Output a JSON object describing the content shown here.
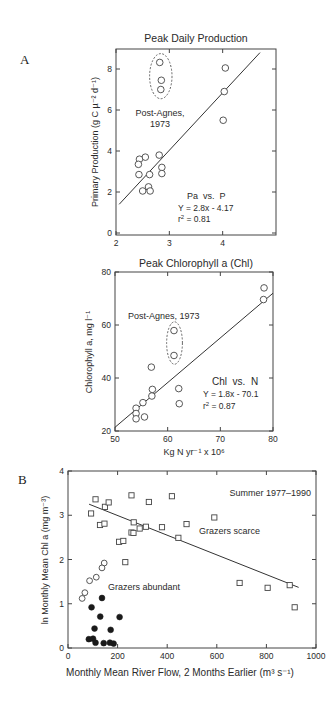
{
  "figure": {
    "panel_labels": [
      "A",
      "B"
    ]
  },
  "chart_data": [
    {
      "id": "A1",
      "type": "scatter",
      "title": "Peak Daily Production",
      "xlabel": "",
      "ylabel": "Primary Production (g C µ⁻² d⁻¹)",
      "xlim": [
        2,
        5
      ],
      "ylim": [
        0,
        9
      ],
      "xticks": [
        2,
        3,
        4
      ],
      "yticks": [
        0,
        2,
        4,
        6,
        8
      ],
      "grid": false,
      "series": [
        {
          "name": "Observations",
          "marker": "open-circle",
          "points": [
            [
              2.82,
              8.32
            ],
            [
              2.85,
              7.45
            ],
            [
              2.84,
              7.0
            ],
            [
              4.05,
              8.05
            ],
            [
              4.03,
              6.9
            ],
            [
              4.01,
              5.5
            ],
            [
              2.81,
              3.8
            ],
            [
              2.55,
              3.7
            ],
            [
              2.44,
              3.6
            ],
            [
              2.42,
              3.35
            ],
            [
              2.86,
              3.2
            ],
            [
              2.43,
              2.85
            ],
            [
              2.63,
              2.85
            ],
            [
              2.86,
              2.9
            ],
            [
              2.61,
              2.25
            ],
            [
              2.5,
              2.05
            ],
            [
              2.64,
              2.05
            ]
          ]
        }
      ],
      "fit_line": {
        "from": [
          2.06,
          1.4
        ],
        "to": [
          4.7,
          8.8
        ]
      },
      "annotations": {
        "highlight_label_1": "Post-Agnes,",
        "highlight_label_2": "1973",
        "relation": "Pa  vs.  P",
        "equation": "Y = 2.8x - 4.17",
        "r2_prefix": "r",
        "r2_sup": "2",
        "r2_value": " = 0.81"
      },
      "highlight_ellipse": {
        "cx": 2.84,
        "cy": 7.65,
        "rx": 0.21,
        "ry": 1.1
      }
    },
    {
      "id": "A2",
      "type": "scatter",
      "title": "Peak Chlorophyll a (Chl)",
      "xlabel": "Kg N yr⁻¹ x 10⁶",
      "ylabel": "Chlorophyll a, mg l⁻¹",
      "xlim": [
        50,
        80
      ],
      "ylim": [
        20,
        80
      ],
      "xticks": [
        50,
        60,
        70,
        80
      ],
      "yticks": [
        20,
        40,
        60,
        80
      ],
      "grid": false,
      "series": [
        {
          "name": "Observations",
          "marker": "open-circle",
          "points": [
            [
              78.3,
              74.0
            ],
            [
              78.2,
              69.6
            ],
            [
              61.2,
              57.9
            ],
            [
              61.2,
              48.5
            ],
            [
              56.9,
              44.1
            ],
            [
              57.1,
              35.7
            ],
            [
              57.0,
              33.2
            ],
            [
              55.3,
              30.7
            ],
            [
              54.0,
              28.6
            ],
            [
              54.0,
              26.6
            ],
            [
              54.0,
              24.6
            ],
            [
              55.6,
              25.3
            ],
            [
              62.1,
              36.0
            ],
            [
              62.2,
              30.3
            ]
          ]
        }
      ],
      "fit_line": {
        "from": [
          50,
          21.4
        ],
        "to": [
          80,
          72
        ]
      },
      "annotations": {
        "highlight_label": "Post-Agnes, 1973",
        "relation": "Chl  vs.  N",
        "equation": "Y = 1.8x - 70.1",
        "r2_prefix": "r",
        "r2_sup": "2",
        "r2_value": " = 0.87"
      },
      "highlight_ellipse": {
        "cx": 61.3,
        "cy": 53.2,
        "rx": 1.5,
        "ry": 8.0
      }
    },
    {
      "id": "B",
      "type": "scatter",
      "title": "",
      "xlabel": "Monthly Mean River Flow, 2 Months Earlier (m³ s⁻¹)",
      "ylabel": "ln Monthly Mean Chl a (mg m⁻³)",
      "xlim": [
        0,
        1000
      ],
      "ylim": [
        0,
        4
      ],
      "xticks": [
        0,
        200,
        400,
        600,
        800,
        1000
      ],
      "yticks": [
        0,
        1,
        2,
        3,
        4
      ],
      "grid": false,
      "series": [
        {
          "name": "Grazers scarce",
          "marker": "open-square",
          "points": [
            [
              93,
              3.04
            ],
            [
              111,
              3.36
            ],
            [
              149,
              3.19
            ],
            [
              164,
              3.29
            ],
            [
              129,
              2.78
            ],
            [
              147,
              2.81
            ],
            [
              256,
              3.45
            ],
            [
              326,
              3.3
            ],
            [
              419,
              3.43
            ],
            [
              265,
              2.84
            ],
            [
              256,
              2.61
            ],
            [
              264,
              2.6
            ],
            [
              289,
              2.7
            ],
            [
              314,
              2.74
            ],
            [
              379,
              2.73
            ],
            [
              445,
              2.49
            ],
            [
              478,
              2.8
            ],
            [
              206,
              2.4
            ],
            [
              223,
              2.42
            ],
            [
              231,
              1.94
            ],
            [
              590,
              2.95
            ],
            [
              692,
              1.47
            ],
            [
              805,
              1.36
            ],
            [
              894,
              1.42
            ],
            [
              914,
              0.92
            ]
          ]
        },
        {
          "name": "Grazers abundant (open)",
          "marker": "open-circle",
          "points": [
            [
              146,
              1.92
            ],
            [
              137,
              1.81
            ],
            [
              114,
              1.6
            ],
            [
              87,
              1.52
            ],
            [
              68,
              1.25
            ],
            [
              57,
              1.12
            ]
          ]
        },
        {
          "name": "Grazers abundant (filled)",
          "marker": "filled-circle",
          "points": [
            [
              137,
              1.13
            ],
            [
              95,
              0.92
            ],
            [
              130,
              0.71
            ],
            [
              208,
              0.7
            ],
            [
              107,
              0.44
            ],
            [
              172,
              0.41
            ],
            [
              84,
              0.2
            ],
            [
              101,
              0.21
            ],
            [
              111,
              0.12
            ],
            [
              144,
              0.11
            ],
            [
              169,
              0.12
            ],
            [
              184,
              0.1
            ]
          ]
        }
      ],
      "fit_line": {
        "from": [
          85,
          3.25
        ],
        "to": [
          930,
          1.37
        ]
      },
      "annotations": {
        "period": "Summer 1977–1990",
        "grazers_scarce": "Grazers scarce",
        "grazers_abundant": "Grazers abundant"
      }
    }
  ]
}
